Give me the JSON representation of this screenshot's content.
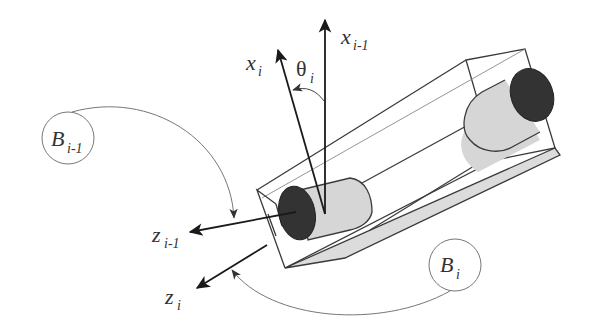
{
  "diagram": {
    "type": "robot-joint-frame-diagram",
    "colors": {
      "stroke": "#3a3a3a",
      "thin_stroke": "#777777",
      "cylinder_fill": "#d6d6d6",
      "cylinder_end": "#333333",
      "box_shadow_face": "#dcdcdc",
      "arrow": "#1a1a1a"
    },
    "labels": {
      "x_i": {
        "base": "x",
        "sub": "i"
      },
      "x_i_minus_1": {
        "base": "x",
        "sub": "i-1"
      },
      "theta_i": {
        "base": "θ",
        "sub": "i"
      },
      "z_i_minus_1": {
        "base": "z",
        "sub": "i-1"
      },
      "z_i": {
        "base": "z",
        "sub": "i"
      },
      "B_i_minus_1": {
        "base": "B",
        "sub": "i-1"
      },
      "B_i": {
        "base": "B",
        "sub": "i"
      }
    }
  }
}
